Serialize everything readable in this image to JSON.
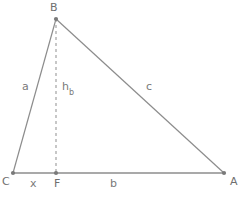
{
  "figure": {
    "background_color": "#ffffff",
    "stroke_color": "#8c8c8c",
    "text_color": "#7a7a7a"
  },
  "vertices": [
    {
      "id": "B",
      "label": "B",
      "x": 56,
      "y": 19,
      "label_x": 50,
      "label_y": 2
    },
    {
      "id": "C",
      "label": "C",
      "x": 13,
      "y": 173,
      "label_x": 2,
      "label_y": 176
    },
    {
      "id": "A",
      "label": "A",
      "x": 224,
      "y": 173,
      "label_x": 230,
      "label_y": 176
    },
    {
      "id": "F",
      "label": "F",
      "x": 56,
      "y": 173,
      "label_x": 54,
      "label_y": 178
    }
  ],
  "segments": [
    {
      "id": "side-a",
      "from": "C",
      "to": "B",
      "style": "solid"
    },
    {
      "id": "side-c",
      "from": "B",
      "to": "A",
      "style": "solid"
    },
    {
      "id": "base-CA",
      "from": "C",
      "to": "A",
      "style": "solid"
    },
    {
      "id": "altitude-hb",
      "from": "B",
      "to": "F",
      "style": "dashed"
    }
  ],
  "side_labels": [
    {
      "id": "a",
      "text": "a",
      "sub": "",
      "x": 22,
      "y": 81
    },
    {
      "id": "hb",
      "text": "h",
      "sub": "b",
      "x": 62,
      "y": 81
    },
    {
      "id": "c",
      "text": "c",
      "sub": "",
      "x": 146,
      "y": 81
    },
    {
      "id": "x",
      "text": "x",
      "sub": "",
      "x": 30,
      "y": 178
    },
    {
      "id": "b",
      "text": "b",
      "sub": "",
      "x": 110,
      "y": 178
    }
  ]
}
